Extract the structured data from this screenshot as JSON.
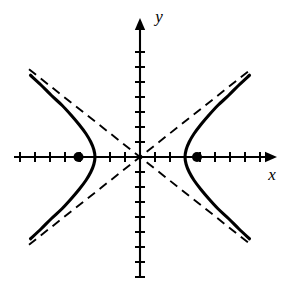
{
  "figure": {
    "background_color": "#ffffff",
    "stroke_color": "#000000",
    "width": 294,
    "height": 282
  },
  "axes": {
    "x_label": "x",
    "y_label": "y",
    "origin_px": {
      "x": 140,
      "y": 157
    },
    "unit_px": 15,
    "x_axis": {
      "start_px": 14,
      "end_px": 277,
      "arrow": "right"
    },
    "y_axis": {
      "start_px": 278,
      "end_px": 18,
      "arrow": "up"
    },
    "x_tick_units": [
      -8,
      -7,
      -6,
      -5,
      -4,
      -3,
      -2,
      -1,
      1,
      2,
      3,
      4,
      5,
      6,
      7,
      8
    ],
    "y_tick_units": [
      -8,
      -7,
      -6,
      -5,
      -4,
      -3,
      -2,
      -1,
      1,
      2,
      3,
      4,
      5,
      6,
      7
    ],
    "tick_half_length_px": 5,
    "grid": false
  },
  "chart_data": {
    "type": "line",
    "title": "",
    "subtitle": "",
    "xlabel": "x",
    "ylabel": "y",
    "xlim": [
      -8.4,
      9.1
    ],
    "ylim": [
      -8.1,
      9.3
    ],
    "grid": false,
    "legend": "none",
    "curve_family": "hyperbola",
    "equation": "x^2/9 - y^2/5.6 = 1",
    "center": [
      0,
      0
    ],
    "semi_axis_a": 3,
    "semi_axis_b": 2.37,
    "asymptote_slope": 0.79,
    "series": [
      {
        "name": "right-branch",
        "style": "solid",
        "points": [
          [
            7.3,
            5.45
          ],
          [
            6.6,
            4.8
          ],
          [
            5.9,
            4.1
          ],
          [
            5.2,
            3.45
          ],
          [
            4.6,
            2.8
          ],
          [
            4.05,
            2.15
          ],
          [
            3.6,
            1.55
          ],
          [
            3.28,
            1.0
          ],
          [
            3.08,
            0.5
          ],
          [
            3.0,
            0.0
          ],
          [
            3.08,
            -0.5
          ],
          [
            3.28,
            -1.0
          ],
          [
            3.6,
            -1.55
          ],
          [
            4.05,
            -2.15
          ],
          [
            4.6,
            -2.8
          ],
          [
            5.2,
            -3.45
          ],
          [
            5.9,
            -4.1
          ],
          [
            6.6,
            -4.8
          ],
          [
            7.3,
            -5.45
          ]
        ]
      },
      {
        "name": "left-branch",
        "style": "solid",
        "points": [
          [
            -7.3,
            5.45
          ],
          [
            -6.6,
            4.8
          ],
          [
            -5.9,
            4.1
          ],
          [
            -5.2,
            3.45
          ],
          [
            -4.6,
            2.8
          ],
          [
            -4.05,
            2.15
          ],
          [
            -3.6,
            1.55
          ],
          [
            -3.28,
            1.0
          ],
          [
            -3.08,
            0.5
          ],
          [
            -3.0,
            0.0
          ],
          [
            -3.08,
            -0.5
          ],
          [
            -3.28,
            -1.0
          ],
          [
            -3.6,
            -1.55
          ],
          [
            -4.05,
            -2.15
          ],
          [
            -4.6,
            -2.8
          ],
          [
            -5.2,
            -3.45
          ],
          [
            -5.9,
            -4.1
          ],
          [
            -6.6,
            -4.8
          ],
          [
            -7.3,
            -5.45
          ]
        ]
      },
      {
        "name": "asymptote-positive-slope",
        "style": "dashed",
        "points": [
          [
            -7.4,
            -5.85
          ],
          [
            7.4,
            5.85
          ]
        ]
      },
      {
        "name": "asymptote-negative-slope",
        "style": "dashed",
        "points": [
          [
            -7.4,
            5.85
          ],
          [
            7.4,
            -5.85
          ]
        ]
      }
    ],
    "markers": [
      {
        "name": "focus-left",
        "x": -4.1,
        "y": 0,
        "shape": "filled-circle",
        "radius_px": 5
      },
      {
        "name": "focus-right",
        "x": 3.8,
        "y": 0,
        "shape": "filled-circle",
        "radius_px": 5
      }
    ],
    "annotations": []
  }
}
